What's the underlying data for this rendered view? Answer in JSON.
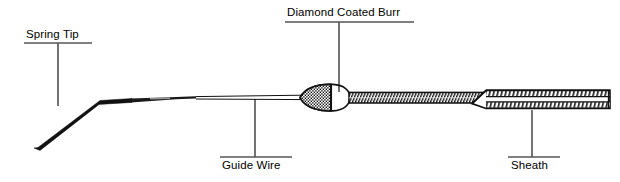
{
  "diagram": {
    "stroke_color": "#000000",
    "background_color": "#ffffff",
    "annotations": [
      {
        "id": "spring-tip",
        "label": "Spring Tip",
        "rule_position": "underline",
        "leader_from": {
          "x": 58,
          "y": 43
        },
        "leader_to": {
          "x": 58,
          "y": 106
        },
        "rule": {
          "x1": 24,
          "x2": 92,
          "y": 43
        }
      },
      {
        "id": "diamond-coated-burr",
        "label": "Diamond Coated Burr",
        "rule_position": "underline",
        "leader_from": {
          "x": 339,
          "y": 22
        },
        "leader_to": {
          "x": 339,
          "y": 92
        },
        "rule": {
          "x1": 285,
          "x2": 414,
          "y": 22
        }
      },
      {
        "id": "guide-wire",
        "label": "Guide Wire",
        "rule_position": "overline",
        "leader_from": {
          "x": 255,
          "y": 99
        },
        "leader_to": {
          "x": 255,
          "y": 157
        },
        "rule": {
          "x1": 220,
          "x2": 292,
          "y": 157
        }
      },
      {
        "id": "sheath",
        "label": "Sheath",
        "rule_position": "overline",
        "leader_from": {
          "x": 532,
          "y": 110
        },
        "leader_to": {
          "x": 532,
          "y": 157
        },
        "rule": {
          "x1": 508,
          "x2": 560,
          "y": 157
        }
      }
    ],
    "parts": {
      "spring_tip": {
        "name": "spring-tip-shape",
        "description": "angled tapering flexible tip bending from lower-left up to horizontal shaft"
      },
      "guide_wire": {
        "name": "guide-wire-shape",
        "description": "thin straight double-line wire running to the burr"
      },
      "burr": {
        "name": "burr-shape",
        "description": "elliptical olive-shaped burr, left portion diamond-grit stippled, right portion plain"
      },
      "drive_shaft": {
        "name": "drive-shaft-shape",
        "description": "helically wound coil shaft shown as dense diagonal hatching"
      },
      "sheath": {
        "name": "sheath-shape",
        "description": "outer protective sheath tube enclosing the drive shaft at the proximal end"
      }
    }
  }
}
